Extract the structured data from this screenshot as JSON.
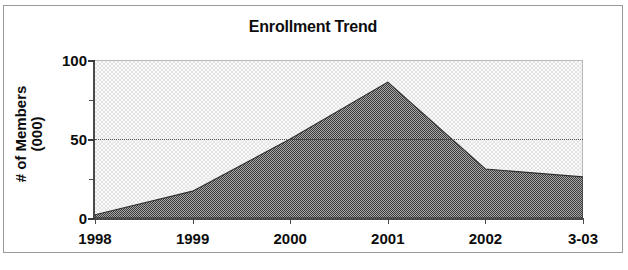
{
  "chart_data": {
    "type": "area",
    "title": "Enrollment Trend",
    "xlabel": "",
    "ylabel": "# of Members (000)",
    "ylabel_line1": "# of Members",
    "ylabel_line2": "(000)",
    "categories": [
      "1998",
      "1999",
      "2000",
      "2001",
      "2002",
      "3-03"
    ],
    "values": [
      2,
      17,
      50,
      86,
      31,
      26
    ],
    "series": [
      {
        "name": "# of Members (000)",
        "values": [
          2,
          17,
          50,
          86,
          31,
          26
        ]
      }
    ],
    "ylim": [
      0,
      100
    ],
    "yticks": [
      0,
      50,
      100
    ],
    "ytick_labels": [
      "0",
      "50",
      "100"
    ],
    "yminor_ticks": [
      25,
      75
    ],
    "gridlines": [
      50
    ],
    "grid": true,
    "legend": false,
    "legend_position": "none",
    "fill_color": "#6b6b6b",
    "plot_background": "#f2f2f2",
    "axis_color": "#3a3a3a",
    "text_color": "#0d0d0d",
    "border_color": "#9a9a9a"
  }
}
